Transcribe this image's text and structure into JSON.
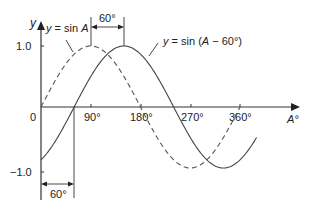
{
  "chart_data": {
    "type": "line",
    "title": "",
    "xlabel": "A°",
    "ylabel": "y",
    "x_ticks": [
      "0",
      "90°",
      "180°",
      "270°",
      "360°"
    ],
    "x_tick_values": [
      0,
      90,
      180,
      270,
      360
    ],
    "y_ticks": [
      "1.0",
      "−1.0"
    ],
    "y_tick_values": [
      1.0,
      -1.0
    ],
    "xlim": [
      0,
      460
    ],
    "ylim": [
      -1.3,
      1.4
    ],
    "grid": false,
    "legend": "none (curves labelled directly)",
    "series": [
      {
        "name": "y = sin A",
        "style": "dashed",
        "formula": "sin(A)",
        "x": [
          0,
          30,
          60,
          90,
          120,
          150,
          180,
          210,
          240,
          270,
          300,
          330,
          360
        ],
        "values": [
          0,
          0.5,
          0.866,
          1.0,
          0.866,
          0.5,
          0,
          -0.5,
          -0.866,
          -1.0,
          -0.866,
          -0.5,
          0
        ]
      },
      {
        "name": "y = sin (A − 60°)",
        "style": "solid",
        "formula": "sin(A - 60)",
        "x": [
          0,
          30,
          60,
          90,
          120,
          150,
          180,
          210,
          240,
          270,
          300,
          330,
          360,
          390
        ],
        "values": [
          -0.866,
          -0.5,
          0,
          0.5,
          0.866,
          1.0,
          0.866,
          0.5,
          0,
          -0.5,
          -0.866,
          -1.0,
          -0.866,
          -0.5
        ]
      }
    ],
    "annotations": [
      {
        "text": "60°",
        "position": "top",
        "description": "phase shift between the peaks at 90° and 150°"
      },
      {
        "text": "60°",
        "position": "bottom",
        "description": "phase shift between 0° and the zero crossing at 60°"
      }
    ]
  },
  "labels": {
    "y_axis": "y",
    "x_axis": "A°",
    "origin": "0",
    "tick_90": "90°",
    "tick_180": "180°",
    "tick_270": "270°",
    "tick_360": "360°",
    "y_pos": "1.0",
    "y_neg": "−1.0",
    "curve_sin_a_prefix": "y",
    "curve_sin_a_eq": " = sin ",
    "curve_sin_a_var": "A",
    "curve_shift_prefix": "y",
    "curve_shift_eq": " = sin (",
    "curve_shift_var": "A",
    "curve_shift_rest": " − 60°)",
    "phase_top": "60°",
    "phase_bottom": "60°"
  }
}
